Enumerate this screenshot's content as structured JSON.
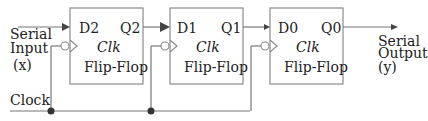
{
  "diagram": {
    "title": "",
    "input": {
      "line1": "Serial",
      "line2": "Input",
      "line3": "(x)"
    },
    "output": {
      "line1": "Serial",
      "line2": "Output",
      "line3": "(y)"
    },
    "clock_label": "Clock",
    "flip_flops": [
      {
        "d": "D2",
        "q": "Q2",
        "clk": "Clk",
        "name": "Flip-Flop"
      },
      {
        "d": "D1",
        "q": "Q1",
        "clk": "Clk",
        "name": "Flip-Flop"
      },
      {
        "d": "D0",
        "q": "Q0",
        "clk": "Clk",
        "name": "Flip-Flop"
      }
    ],
    "colors": {
      "line": "#777777",
      "box": "#8a8a8a",
      "dot": "#333333",
      "text": "#222222"
    }
  }
}
